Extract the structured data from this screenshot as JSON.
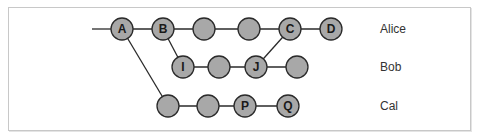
{
  "diagram": {
    "style": {
      "node_fill": "#a8a8a8",
      "node_stroke": "#2a2a2a",
      "edge_color": "#2a2a2a",
      "node_radius": 11
    },
    "lanes": [
      {
        "name": "Alice",
        "y": 29
      },
      {
        "name": "Bob",
        "y": 67
      },
      {
        "name": "Cal",
        "y": 106
      }
    ],
    "nodes": [
      {
        "id": "A",
        "label": "A",
        "x": 122,
        "y": 29
      },
      {
        "id": "B",
        "label": "B",
        "x": 163,
        "y": 29
      },
      {
        "id": "a3",
        "label": "",
        "x": 204,
        "y": 29
      },
      {
        "id": "a4",
        "label": "",
        "x": 249,
        "y": 29
      },
      {
        "id": "C",
        "label": "C",
        "x": 290,
        "y": 29
      },
      {
        "id": "D",
        "label": "D",
        "x": 331,
        "y": 29
      },
      {
        "id": "I",
        "label": "I",
        "x": 183,
        "y": 67
      },
      {
        "id": "b2",
        "label": "",
        "x": 219,
        "y": 67
      },
      {
        "id": "J",
        "label": "J",
        "x": 256,
        "y": 67
      },
      {
        "id": "b4",
        "label": "",
        "x": 297,
        "y": 67
      },
      {
        "id": "c1",
        "label": "",
        "x": 168,
        "y": 106
      },
      {
        "id": "c2",
        "label": "",
        "x": 208,
        "y": 106
      },
      {
        "id": "P",
        "label": "P",
        "x": 245,
        "y": 106
      },
      {
        "id": "Q",
        "label": "Q",
        "x": 288,
        "y": 106
      }
    ],
    "edges": [
      {
        "from": "start",
        "to": "A",
        "x1": 92,
        "y1": 29
      },
      {
        "from": "A",
        "to": "B"
      },
      {
        "from": "B",
        "to": "a3"
      },
      {
        "from": "a3",
        "to": "a4"
      },
      {
        "from": "a4",
        "to": "C"
      },
      {
        "from": "C",
        "to": "D"
      },
      {
        "from": "B",
        "to": "I"
      },
      {
        "from": "I",
        "to": "b2"
      },
      {
        "from": "b2",
        "to": "J"
      },
      {
        "from": "J",
        "to": "b4"
      },
      {
        "from": "J",
        "to": "C"
      },
      {
        "from": "A",
        "to": "c1"
      },
      {
        "from": "c1",
        "to": "c2"
      },
      {
        "from": "c2",
        "to": "P"
      },
      {
        "from": "P",
        "to": "Q"
      }
    ],
    "lane_label_x": 380
  }
}
